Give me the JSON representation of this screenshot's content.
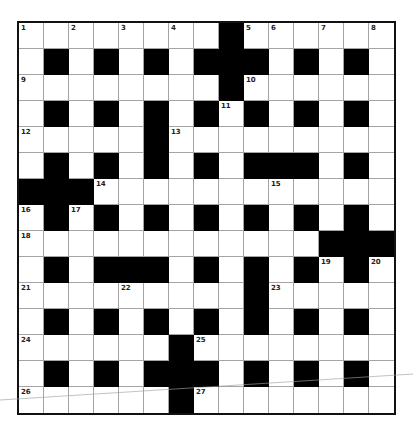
{
  "puzzle": {
    "rows": 15,
    "cols": 15,
    "grid": [
      "........#......",
      ".#.#.#.###.#.#.",
      "........#......",
      ".#.#.#.#.#.#.#.",
      ".....#.........",
      ".#.#.#.#.###.#.",
      "###............",
      ".#.#.#.#.#.#.#.",
      "............###",
      ".#.###.#.#.#.#.",
      ".........#.....",
      ".#.#.#.#.#.#.#.",
      "......#........",
      ".#.#.###.#.#.#.",
      "......#........"
    ],
    "numbers": [
      {
        "r": 0,
        "c": 0,
        "n": "1"
      },
      {
        "r": 0,
        "c": 2,
        "n": "2"
      },
      {
        "r": 0,
        "c": 4,
        "n": "3"
      },
      {
        "r": 0,
        "c": 6,
        "n": "4"
      },
      {
        "r": 0,
        "c": 9,
        "n": "5"
      },
      {
        "r": 0,
        "c": 10,
        "n": "6"
      },
      {
        "r": 0,
        "c": 12,
        "n": "7"
      },
      {
        "r": 0,
        "c": 14,
        "n": "8"
      },
      {
        "r": 2,
        "c": 0,
        "n": "9"
      },
      {
        "r": 2,
        "c": 9,
        "n": "10"
      },
      {
        "r": 3,
        "c": 8,
        "n": "11"
      },
      {
        "r": 4,
        "c": 0,
        "n": "12"
      },
      {
        "r": 4,
        "c": 6,
        "n": "13"
      },
      {
        "r": 6,
        "c": 3,
        "n": "14"
      },
      {
        "r": 6,
        "c": 10,
        "n": "15"
      },
      {
        "r": 7,
        "c": 0,
        "n": "16"
      },
      {
        "r": 7,
        "c": 2,
        "n": "17"
      },
      {
        "r": 8,
        "c": 0,
        "n": "18"
      },
      {
        "r": 9,
        "c": 12,
        "n": "19"
      },
      {
        "r": 9,
        "c": 14,
        "n": "20"
      },
      {
        "r": 10,
        "c": 0,
        "n": "21"
      },
      {
        "r": 10,
        "c": 4,
        "n": "22"
      },
      {
        "r": 10,
        "c": 10,
        "n": "23"
      },
      {
        "r": 12,
        "c": 0,
        "n": "24"
      },
      {
        "r": 12,
        "c": 7,
        "n": "25"
      },
      {
        "r": 14,
        "c": 0,
        "n": "26"
      },
      {
        "r": 14,
        "c": 7,
        "n": "27"
      }
    ]
  },
  "colors": {
    "block": "#000000",
    "empty": "#ffffff",
    "gridline": "#a4a4a4",
    "border": "#111111"
  }
}
